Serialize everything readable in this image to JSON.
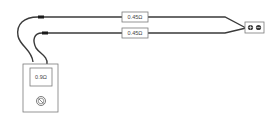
{
  "diagram": {
    "resistor_top": {
      "label": "0.45Ω"
    },
    "resistor_bottom": {
      "label": "0.45Ω"
    },
    "meter": {
      "reading": "0.9Ω",
      "dial_icon": "dial-icon"
    },
    "terminals": {
      "positive": "⊕",
      "negative": "⊖"
    },
    "colors": {
      "wire": "#3a3a3a",
      "outline": "#7a7a7a",
      "background": "#ffffff"
    }
  }
}
